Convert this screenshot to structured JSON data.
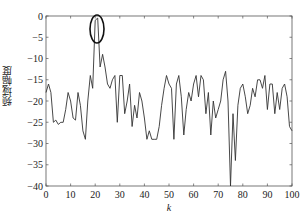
{
  "chart_data": {
    "type": "line",
    "title": "",
    "xlabel": "k",
    "ylabel": "频域幅度",
    "xlim": [
      0,
      100
    ],
    "ylim": [
      -40,
      0
    ],
    "xticks": [
      0,
      10,
      20,
      30,
      40,
      50,
      60,
      70,
      80,
      90,
      100
    ],
    "yticks": [
      0,
      -5,
      -10,
      -15,
      -20,
      -25,
      -30,
      -35,
      -40
    ],
    "xtick_labels": [
      "0",
      "10",
      "20",
      "30",
      "40",
      "50",
      "60",
      "70",
      "80",
      "90",
      "100"
    ],
    "ytick_labels": [
      "0",
      "−5",
      "−10",
      "−15",
      "−20",
      "−25",
      "−30",
      "−35",
      "−40"
    ],
    "grid": false,
    "legend": null,
    "annotations": [
      {
        "type": "ellipse",
        "center_k": 21,
        "center_value": -3,
        "description": "highlighted peak near k=20-21"
      }
    ],
    "series": [
      {
        "name": "频域幅度",
        "color": "#333333",
        "x": [
          0,
          1,
          2,
          3,
          4,
          5,
          6,
          7,
          8,
          9,
          10,
          11,
          12,
          13,
          14,
          15,
          16,
          17,
          18,
          19,
          20,
          21,
          22,
          23,
          24,
          25,
          26,
          27,
          28,
          29,
          30,
          31,
          32,
          33,
          34,
          35,
          36,
          37,
          38,
          39,
          40,
          41,
          42,
          43,
          44,
          45,
          46,
          47,
          48,
          49,
          50,
          51,
          52,
          53,
          54,
          55,
          56,
          57,
          58,
          59,
          60,
          61,
          62,
          63,
          64,
          65,
          66,
          67,
          68,
          69,
          70,
          71,
          72,
          73,
          74,
          75,
          76,
          77,
          78,
          79,
          80,
          81,
          82,
          83,
          84,
          85,
          86,
          87,
          88,
          89,
          90,
          91,
          92,
          93,
          94,
          95,
          96,
          97,
          98,
          99,
          100
        ],
        "values": [
          -18,
          -16,
          -18,
          -25,
          -24.5,
          -25.5,
          -25,
          -25,
          -22,
          -18,
          -20,
          -24,
          -24.5,
          -18,
          -21,
          -27,
          -29,
          -20,
          -14,
          -17,
          -1,
          -0.5,
          -12,
          -9,
          -12,
          -16,
          -17,
          -15,
          -14,
          -25,
          -14,
          -14,
          -23,
          -20,
          -16,
          -26,
          -21,
          -24,
          -18,
          -20,
          -24,
          -29,
          -27,
          -29,
          -29,
          -29,
          -26,
          -21,
          -17,
          -14,
          -16,
          -17,
          -29,
          -16,
          -14,
          -19,
          -28,
          -22,
          -18,
          -20,
          -16,
          -14,
          -19,
          -14,
          -15,
          -23,
          -18,
          -28,
          -20,
          -24,
          -22,
          -20,
          -15,
          -13,
          -20,
          -40,
          -23,
          -34,
          -21,
          -17,
          -16,
          -19,
          -23,
          -21,
          -17,
          -19,
          -15,
          -15,
          -17,
          -14,
          -22,
          -16,
          -16,
          -23,
          -18,
          -22,
          -17,
          -16,
          -19,
          -26,
          -27
        ]
      }
    ]
  },
  "labels": {
    "xlabel": "k",
    "ylabel": "频域幅度"
  }
}
